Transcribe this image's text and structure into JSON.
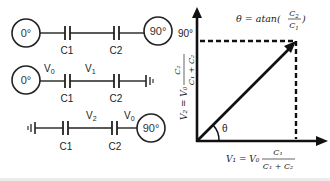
{
  "circuit": {
    "row1": {
      "source_left": "0°",
      "source_right": "90°",
      "cap1": "C1",
      "cap2": "C2"
    },
    "row2": {
      "source_left": "0°",
      "node_v0": "V",
      "node_v0_sub": "0",
      "node_v1": "V",
      "node_v1_sub": "1",
      "cap1": "C1",
      "cap2": "C2"
    },
    "row3": {
      "source_right": "90°",
      "node_v2": "V",
      "node_v2_sub": "2",
      "node_v0": "V",
      "node_v0_sub": "0",
      "cap1": "C1",
      "cap2": "C2"
    }
  },
  "phasor": {
    "theta_formula": {
      "lhs": "θ = atan(",
      "num": "C",
      "num_sub": "2",
      "den": "C",
      "den_sub": "1",
      "rhs": ")"
    },
    "y_tick": "90°",
    "angle_label": "θ",
    "x_formula": {
      "lhs": "V₁ = V₀",
      "num": "C₁",
      "den": "C₁ + C₂"
    },
    "y_formula": {
      "lhs": "V₂ = V₀",
      "num": "C₂",
      "den": "C₁ + C₂"
    }
  }
}
